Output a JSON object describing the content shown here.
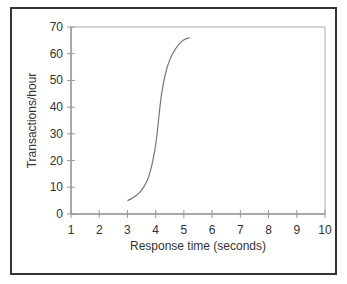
{
  "chart_data": {
    "type": "line",
    "title": "",
    "xlabel": "Response time (seconds)",
    "ylabel": "Transactions/hour",
    "xlim": [
      1,
      10
    ],
    "ylim": [
      0,
      70
    ],
    "xticks": [
      1,
      2,
      3,
      4,
      5,
      6,
      7,
      8,
      9,
      10
    ],
    "yticks": [
      0,
      10,
      20,
      30,
      40,
      50,
      60,
      70
    ],
    "grid": false,
    "legend": null,
    "series": [
      {
        "name": "Transactions vs response time",
        "x": [
          3.0,
          3.3,
          3.6,
          3.8,
          4.0,
          4.1,
          4.2,
          4.35,
          4.5,
          4.7,
          4.9,
          5.05,
          5.2
        ],
        "y": [
          5,
          6.5,
          10,
          15,
          25,
          35,
          45,
          53,
          58,
          62,
          64.5,
          65.5,
          66
        ]
      }
    ],
    "colors": {
      "line": "#777777",
      "axis": "#999999",
      "frame": "#333333"
    }
  }
}
